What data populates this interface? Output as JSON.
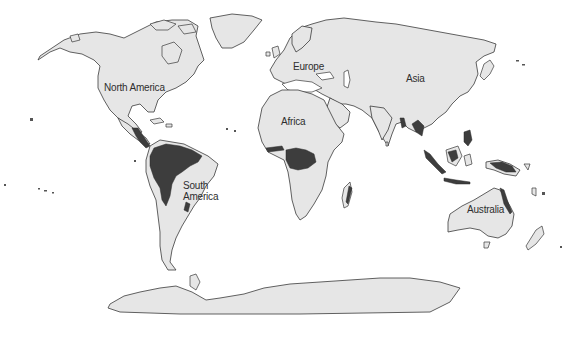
{
  "map": {
    "type": "world-map",
    "projection": "equirectangular-like",
    "colors": {
      "background": "#ffffff",
      "land": "#e6e6e6",
      "coastline": "#3a3a3a",
      "tropical_rainforest": "#3d3d3d",
      "label_text": "#2e2e2e"
    },
    "highlighted_regions": [
      "Amazon basin",
      "Congo basin",
      "Southeast Asia",
      "Indonesia",
      "New Guinea",
      "Central America",
      "West Africa coast",
      "Madagascar east coast",
      "Northeast Australia"
    ],
    "labels": {
      "north_america": "North America",
      "europe": "Europe",
      "asia": "Asia",
      "africa": "Africa",
      "south_america_line1": "South",
      "south_america_line2": "America",
      "australia": "Australia"
    }
  }
}
